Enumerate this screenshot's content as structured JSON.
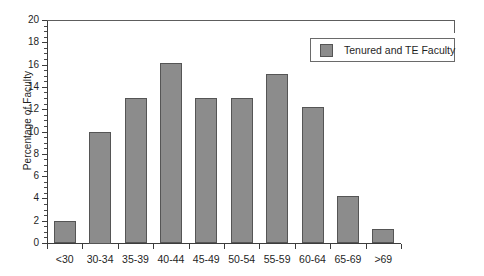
{
  "chart_data": {
    "type": "bar",
    "title": "",
    "xlabel": "",
    "ylabel": "Percentage of Faculty",
    "categories": [
      "<30",
      "30-34",
      "35-39",
      "40-44",
      "45-49",
      "50-54",
      "55-59",
      "60-64",
      "65-69",
      ">69"
    ],
    "values": [
      2.0,
      10.0,
      13.0,
      16.1,
      13.0,
      13.0,
      15.2,
      12.2,
      4.2,
      1.3
    ],
    "series": [
      {
        "name": "Tenured and TE Faculty",
        "values": [
          2.0,
          10.0,
          13.0,
          16.1,
          13.0,
          13.0,
          15.2,
          12.2,
          4.2,
          1.3
        ]
      }
    ],
    "ylim": [
      0,
      20
    ],
    "y_tick_step": 2,
    "y_minor_tick_step": 0.5,
    "y_ticks": [
      0,
      2,
      4,
      6,
      8,
      10,
      12,
      14,
      16,
      18,
      20
    ],
    "y_tick_labels": [
      "0",
      "2",
      "4",
      "6",
      "8",
      "10",
      "12",
      "14",
      "16",
      "18",
      "20"
    ],
    "grid": false,
    "legend_position": "top-right",
    "bar_color": "#8c8c8c",
    "bar_edge_color": "#555555",
    "axis_color": "#3c3c3c",
    "background_color": "#ffffff"
  },
  "legend": {
    "entries": [
      {
        "label": "Tenured and TE Faculty",
        "color": "#8c8c8c"
      }
    ]
  }
}
